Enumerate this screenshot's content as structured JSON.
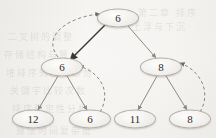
{
  "figure": {
    "type": "binary-tree-diagram",
    "caption": "",
    "background_color": "#f7f6f4",
    "node_fill_color": "#f2f0ed",
    "node_stroke_color": "#b5b1aa",
    "edge_color": "#8d8a85",
    "highlight_edge_color": "#3a3734",
    "dashed_arrow_color": "#8b8884"
  },
  "tree": {
    "nodes": [
      {
        "id": "root",
        "label": "6",
        "x": 118,
        "y": 18,
        "level": 0,
        "position": "root"
      },
      {
        "id": "n-l",
        "label": "6",
        "x": 62,
        "y": 67,
        "level": 1,
        "position": "left-child"
      },
      {
        "id": "n-r",
        "label": "8",
        "x": 161,
        "y": 67,
        "level": 1,
        "position": "right-child"
      },
      {
        "id": "n-ll",
        "label": "12",
        "x": 33,
        "y": 119,
        "level": 2,
        "position": "left-left-leaf"
      },
      {
        "id": "n-lr",
        "label": "6",
        "x": 90,
        "y": 119,
        "level": 2,
        "position": "left-right-leaf"
      },
      {
        "id": "n-rl",
        "label": "11",
        "x": 135,
        "y": 119,
        "level": 2,
        "position": "right-left-leaf"
      },
      {
        "id": "n-rr",
        "label": "8",
        "x": 190,
        "y": 119,
        "level": 2,
        "position": "right-right-leaf"
      }
    ],
    "edges": [
      {
        "id": "e-root-left",
        "from": "root",
        "to": "n-l",
        "style": "solid",
        "emphasis": "strong",
        "arrowhead": true
      },
      {
        "id": "e-root-right",
        "from": "root",
        "to": "n-r",
        "style": "solid",
        "emphasis": "normal",
        "arrowhead": true
      },
      {
        "id": "e-l-ll",
        "from": "n-l",
        "to": "n-ll",
        "style": "solid",
        "emphasis": "normal",
        "arrowhead": true
      },
      {
        "id": "e-l-lr",
        "from": "n-l",
        "to": "n-lr",
        "style": "solid",
        "emphasis": "normal",
        "arrowhead": true
      },
      {
        "id": "e-r-rl",
        "from": "n-r",
        "to": "n-rl",
        "style": "solid",
        "emphasis": "normal",
        "arrowhead": true
      },
      {
        "id": "e-r-rr",
        "from": "n-r",
        "to": "n-rr",
        "style": "solid",
        "emphasis": "normal",
        "arrowhead": true
      }
    ],
    "dashed_arrows": [
      {
        "id": "a-left-to-root",
        "from": "n-l",
        "to": "root",
        "style": "dashed",
        "curve": "left-bulge",
        "arrowhead": true
      },
      {
        "id": "a-lr-to-left",
        "from": "n-lr",
        "to": "n-l",
        "style": "dashed",
        "curve": "right-bulge",
        "arrowhead": true
      },
      {
        "id": "a-rr-to-right",
        "from": "n-rr",
        "to": "n-r",
        "style": "dashed",
        "curve": "right-bulge",
        "arrowhead": true
      }
    ]
  },
  "bleed_through_text": [
    {
      "text": "第二章  排序",
      "x": 138,
      "y": 6
    },
    {
      "text": "二叉树的调整",
      "x": 8,
      "y": 30
    },
    {
      "text": "存储结构与算法",
      "x": 4,
      "y": 48
    },
    {
      "text": "堆排序的基本思想",
      "x": 6,
      "y": 66
    },
    {
      "text": "关键字比较次数",
      "x": 10,
      "y": 84
    },
    {
      "text": "排序稳定性分析",
      "x": 12,
      "y": 102
    },
    {
      "text": "算法时间复杂度",
      "x": 16,
      "y": 124
    },
    {
      "text": "上浮与下沉",
      "x": 132,
      "y": 20
    }
  ]
}
